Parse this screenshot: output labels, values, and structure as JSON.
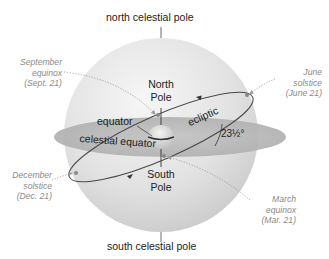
{
  "diagram": {
    "labels": {
      "north_celestial_pole": "north celestial pole",
      "south_celestial_pole": "south celestial pole",
      "north_pole": [
        "North",
        "Pole"
      ],
      "south_pole": [
        "South",
        "Pole"
      ],
      "equator": "equator",
      "celestial_equator": "celestial equator",
      "ecliptic": "ecliptic",
      "tilt_angle": "23½°"
    },
    "events": {
      "september_equinox": [
        "September",
        "equinox",
        "(Sept. 21)"
      ],
      "june_solstice": [
        "June",
        "solstice",
        "(June 21)"
      ],
      "december_solstice": [
        "December",
        "solstice",
        "(Dec. 21)"
      ],
      "march_equinox": [
        "March",
        "equinox",
        "(Mar. 21)"
      ]
    },
    "colors": {
      "sphere_light": "#ececec",
      "sphere_dark": "#c9c9c9",
      "equatorial_plane": "#b8b8b8",
      "ecliptic_line": "#4a4a4a",
      "annotation_text": "#8a8a8a",
      "label_text": "#222222"
    }
  }
}
